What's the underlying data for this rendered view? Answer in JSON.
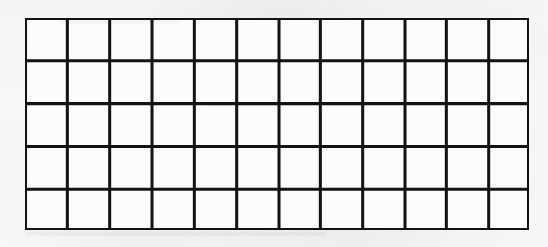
{
  "document": {
    "kind": "scanned-blank-grid",
    "title": "Blank grid table",
    "description": "Scanned page showing an empty ruled grid of rectangular cells",
    "background_color": "#fdfdfc",
    "ink_color": "#131313",
    "cell_fill_color": "#fcfcfa"
  },
  "grid": {
    "columns": 12,
    "rows": 5,
    "total_cells": 60,
    "outer_border": true,
    "outer_border_width_px": 4,
    "inner_line_width_px": 3,
    "origin_x_px": 27,
    "origin_y_px": 20,
    "right_edge_px": 527,
    "bottom_edge_px": 228,
    "cell_width_px": 42,
    "cell_height_px": 42,
    "column_line_positions_px": [
      27,
      69,
      111,
      153,
      195,
      237,
      279,
      320,
      362,
      404,
      445,
      487,
      527
    ],
    "row_line_positions_px": [
      20,
      62,
      104,
      146,
      188,
      228
    ],
    "cell_contents": [
      [
        "",
        "",
        "",
        "",
        "",
        "",
        "",
        "",
        "",
        "",
        "",
        ""
      ],
      [
        "",
        "",
        "",
        "",
        "",
        "",
        "",
        "",
        "",
        "",
        "",
        ""
      ],
      [
        "",
        "",
        "",
        "",
        "",
        "",
        "",
        "",
        "",
        "",
        "",
        ""
      ],
      [
        "",
        "",
        "",
        "",
        "",
        "",
        "",
        "",
        "",
        "",
        "",
        ""
      ],
      [
        "",
        "",
        "",
        "",
        "",
        "",
        "",
        "",
        "",
        "",
        "",
        ""
      ]
    ]
  }
}
